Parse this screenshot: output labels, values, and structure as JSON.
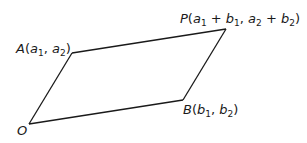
{
  "diagram": {
    "type": "parallelogram",
    "stroke_color": "#1a1a1a",
    "vertices": {
      "O": {
        "x": 29,
        "y": 124
      },
      "A": {
        "x": 72,
        "y": 53
      },
      "P": {
        "x": 226,
        "y": 29
      },
      "B": {
        "x": 183,
        "y": 100
      }
    },
    "labels": {
      "O": {
        "name": "O"
      },
      "A": {
        "name": "A",
        "open": "(",
        "c1": "a",
        "c1_sub": "1",
        "sep": ", ",
        "c2": "a",
        "c2_sub": "2",
        "close": ")"
      },
      "B": {
        "name": "B",
        "open": "(",
        "c1": "b",
        "c1_sub": "1",
        "sep": ", ",
        "c2": "b",
        "c2_sub": "2",
        "close": ")"
      },
      "P": {
        "name": "P",
        "open": "(",
        "t1": "a",
        "t1_sub": "1",
        "plus1": " + ",
        "t2": "b",
        "t2_sub": "1",
        "sep": ", ",
        "t3": "a",
        "t3_sub": "2",
        "plus2": " + ",
        "t4": "b",
        "t4_sub": "2",
        "close": ")"
      }
    }
  }
}
